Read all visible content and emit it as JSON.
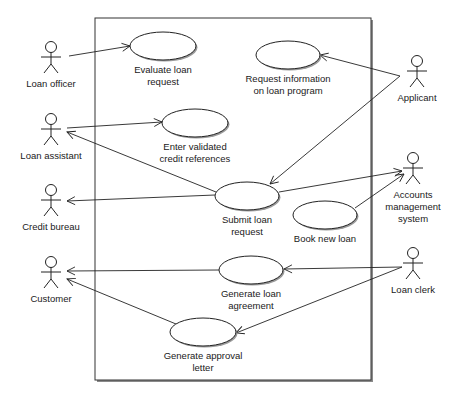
{
  "diagram": {
    "type": "UML use case diagram",
    "system_boundary": {
      "x": 95,
      "y": 18,
      "width": 276,
      "height": 362
    },
    "actors": [
      {
        "id": "loan_officer",
        "label": "Loan officer",
        "x": 51,
        "y": 47,
        "label_lines": [
          "Loan officer"
        ]
      },
      {
        "id": "loan_assistant",
        "label": "Loan assistant",
        "x": 51,
        "y": 119,
        "label_lines": [
          "Loan assistant"
        ]
      },
      {
        "id": "credit_bureau",
        "label": "Credit bureau",
        "x": 51,
        "y": 190,
        "label_lines": [
          "Credit bureau"
        ]
      },
      {
        "id": "customer",
        "label": "Customer",
        "x": 51,
        "y": 262,
        "label_lines": [
          "Customer"
        ]
      },
      {
        "id": "applicant",
        "label": "Applicant",
        "x": 417,
        "y": 61,
        "label_lines": [
          "Applicant"
        ]
      },
      {
        "id": "accounts_management_system",
        "label": "Accounts management system",
        "x": 413,
        "y": 158,
        "label_lines": [
          "Accounts",
          "management",
          "system"
        ]
      },
      {
        "id": "loan_clerk",
        "label": "Loan clerk",
        "x": 413,
        "y": 253,
        "label_lines": [
          "Loan clerk"
        ]
      }
    ],
    "use_cases": [
      {
        "id": "evaluate_loan_request",
        "label": "Evaluate loan request",
        "cx": 163,
        "cy": 46,
        "rx": 33,
        "ry": 14,
        "label_lines": [
          "Evaluate loan",
          "request"
        ]
      },
      {
        "id": "request_information",
        "label": "Request information on loan program",
        "cx": 288,
        "cy": 55,
        "rx": 32,
        "ry": 14,
        "label_lines": [
          "Request information",
          "on loan program"
        ]
      },
      {
        "id": "enter_validated_credit_references",
        "label": "Enter validated credit references",
        "cx": 195,
        "cy": 123,
        "rx": 33,
        "ry": 14,
        "label_lines": [
          "Enter validated",
          "credit references"
        ]
      },
      {
        "id": "submit_loan_request",
        "label": "Submit loan request",
        "cx": 247,
        "cy": 196,
        "rx": 32,
        "ry": 14,
        "label_lines": [
          "Submit loan",
          "request"
        ]
      },
      {
        "id": "book_new_loan",
        "label": "Book new loan",
        "cx": 325,
        "cy": 215,
        "rx": 32,
        "ry": 14,
        "label_lines": [
          "Book new loan"
        ]
      },
      {
        "id": "generate_loan_agreement",
        "label": "Generate loan agreement",
        "cx": 251,
        "cy": 270,
        "rx": 32,
        "ry": 14,
        "label_lines": [
          "Generate loan",
          "agreement"
        ]
      },
      {
        "id": "generate_approval_letter",
        "label": "Generate approval letter",
        "cx": 203,
        "cy": 332,
        "rx": 33,
        "ry": 14,
        "label_lines": [
          "Generate approval",
          "letter"
        ]
      }
    ],
    "associations": [
      {
        "from": "loan_officer",
        "to": "evaluate_loan_request",
        "x1": 69,
        "y1": 56,
        "x2": 130,
        "y2": 46,
        "arrow": "end"
      },
      {
        "from": "loan_assistant",
        "to": "enter_validated_credit_references",
        "x1": 67,
        "y1": 128,
        "x2": 162,
        "y2": 122,
        "arrow": "end"
      },
      {
        "from": "submit_loan_request",
        "to": "loan_assistant",
        "x1": 216,
        "y1": 192,
        "x2": 67,
        "y2": 132,
        "arrow": "end"
      },
      {
        "from": "submit_loan_request",
        "to": "credit_bureau",
        "x1": 215,
        "y1": 195,
        "x2": 67,
        "y2": 201,
        "arrow": "end"
      },
      {
        "from": "applicant",
        "to": "request_information",
        "x1": 400,
        "y1": 76,
        "x2": 320,
        "y2": 55,
        "arrow": "end"
      },
      {
        "from": "applicant",
        "to": "submit_loan_request",
        "x1": 400,
        "y1": 76,
        "x2": 270,
        "y2": 184,
        "arrow": "end"
      },
      {
        "from": "submit_loan_request",
        "to": "accounts_management_system",
        "x1": 279,
        "y1": 192,
        "x2": 402,
        "y2": 171,
        "arrow": "end"
      },
      {
        "from": "book_new_loan",
        "to": "accounts_management_system",
        "x1": 355,
        "y1": 208,
        "x2": 404,
        "y2": 174,
        "arrow": "end"
      },
      {
        "from": "loan_clerk",
        "to": "generate_loan_agreement",
        "x1": 402,
        "y1": 267,
        "x2": 284,
        "y2": 269,
        "arrow": "end"
      },
      {
        "from": "loan_clerk",
        "to": "generate_approval_letter",
        "x1": 402,
        "y1": 267,
        "x2": 236,
        "y2": 333,
        "arrow": "end"
      },
      {
        "from": "generate_loan_agreement",
        "to": "customer",
        "x1": 219,
        "y1": 270,
        "x2": 67,
        "y2": 271,
        "arrow": "end"
      },
      {
        "from": "generate_approval_letter",
        "to": "customer",
        "x1": 176,
        "y1": 324,
        "x2": 67,
        "y2": 279,
        "arrow": "end"
      }
    ]
  }
}
